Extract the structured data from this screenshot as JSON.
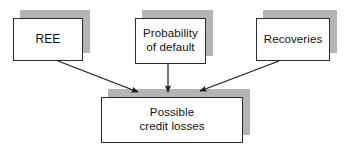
{
  "diagram": {
    "type": "flow-convergence",
    "colors": {
      "box_fill": "#ffffff",
      "box_border": "#2b2b2b",
      "shadow": "#b4b4b4",
      "arrow": "#1a1a1a",
      "text": "#111111",
      "background": "#ffffff"
    },
    "nodes": [
      {
        "id": "ree",
        "label": "REE",
        "role": "input",
        "position": {
          "x": 13,
          "y": 18,
          "width": 70,
          "height": 43
        },
        "shadow_offset": {
          "x": 7,
          "y": -8
        }
      },
      {
        "id": "probability-of-default",
        "label": "Probability\nof default",
        "role": "input",
        "position": {
          "x": 135,
          "y": 18,
          "width": 71,
          "height": 46
        },
        "shadow_offset": {
          "x": 7,
          "y": -8
        }
      },
      {
        "id": "recoveries",
        "label": "Recoveries",
        "role": "input",
        "position": {
          "x": 256,
          "y": 18,
          "width": 74,
          "height": 43
        },
        "shadow_offset": {
          "x": 7,
          "y": -8
        }
      },
      {
        "id": "possible-credit-losses",
        "label": "Possible\ncredit losses",
        "role": "output",
        "position": {
          "x": 101,
          "y": 97,
          "width": 142,
          "height": 46
        },
        "shadow_offset": {
          "x": 7,
          "y": -8
        }
      }
    ],
    "edges": [
      {
        "id": "ree-to-losses",
        "from": "ree",
        "to": "possible-credit-losses",
        "direction": "down-right",
        "start": {
          "x": 58,
          "y": 61
        },
        "end": {
          "x": 140,
          "y": 93
        }
      },
      {
        "id": "pd-to-losses",
        "from": "probability-of-default",
        "to": "possible-credit-losses",
        "direction": "down",
        "start": {
          "x": 168,
          "y": 64
        },
        "end": {
          "x": 168,
          "y": 93
        }
      },
      {
        "id": "recoveries-to-losses",
        "from": "recoveries",
        "to": "possible-credit-losses",
        "direction": "down-left",
        "start": {
          "x": 279,
          "y": 61
        },
        "end": {
          "x": 198,
          "y": 92
        }
      }
    ]
  }
}
